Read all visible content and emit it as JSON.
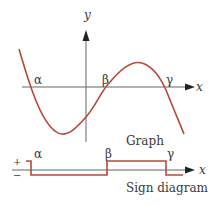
{
  "graph": {
    "axis_x_label": "x",
    "axis_y_label": "y",
    "roots": [
      "α",
      "β",
      "γ"
    ],
    "caption": "Graph",
    "curve_color": "#b5493b",
    "axis_color": "#555555"
  },
  "sign_diagram": {
    "plus": "+",
    "minus": "−",
    "roots": [
      "α",
      "β",
      "γ"
    ],
    "axis_label": "x",
    "caption": "Sign diagram",
    "signs": [
      "+",
      "−",
      "+",
      "−"
    ]
  }
}
